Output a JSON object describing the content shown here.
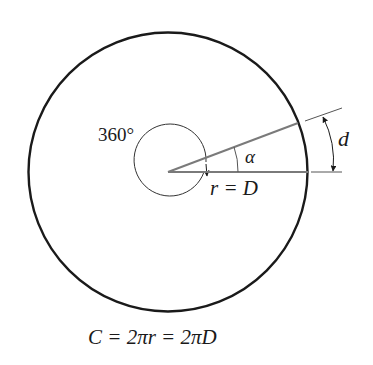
{
  "diagram": {
    "labels": {
      "full_angle": "360°",
      "alpha": "α",
      "radius": "r = D",
      "arc_length": "d",
      "formula": "C = 2πr = 2πD"
    },
    "colors": {
      "outline": "#1a1a1a",
      "ray": "#7a7a7a",
      "background": "#ffffff"
    }
  }
}
